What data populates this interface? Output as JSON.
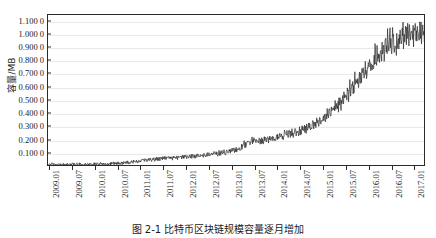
{
  "figure": {
    "caption": "图 2-1  比特币区块链规模容量逐月增加",
    "background": "#ffffff",
    "line_color": "#2b2b2b",
    "grid_color": "#e9e9e9",
    "axis_color": "#2b2b2b"
  },
  "chart_data": {
    "type": "line",
    "title": "",
    "xlabel": "",
    "ylabel": "容量/MB",
    "ylim": [
      0,
      1.15
    ],
    "ytick_labels": [
      "1.100 0",
      "1.000 0",
      "0.900 0",
      "0.800 0",
      "0.700 0",
      "0.600 0",
      "0.500 0",
      "0.400 0",
      "0.300 0",
      "0.200 0",
      "0.100 0"
    ],
    "ytick_values": [
      1.1,
      1.0,
      0.9,
      0.8,
      0.7,
      0.6,
      0.5,
      0.4,
      0.3,
      0.2,
      0.1
    ],
    "xtick_labels": [
      "2009.01",
      "2009.07",
      "2010.01",
      "2010.07",
      "2011.01",
      "2011.07",
      "2012.01",
      "2012.07",
      "2013.01",
      "2013.07",
      "2014.01",
      "2014.07",
      "2015.01",
      "2015.07",
      "2016.01",
      "2016.07",
      "2017.01"
    ],
    "grid": "horizontal",
    "legend": "none",
    "series": [
      {
        "name": "平均区块容量",
        "x_start": "2009.01",
        "x_end": "2017.04",
        "values": [
          0.002,
          0.002,
          0.002,
          0.003,
          0.002,
          0.002,
          0.003,
          0.002,
          0.002,
          0.003,
          0.002,
          0.003,
          0.002,
          0.003,
          0.003,
          0.002,
          0.003,
          0.003,
          0.002,
          0.003,
          0.003,
          0.003,
          0.004,
          0.003,
          0.003,
          0.004,
          0.003,
          0.004,
          0.004,
          0.003,
          0.004,
          0.004,
          0.005,
          0.004,
          0.005,
          0.004,
          0.005,
          0.005,
          0.006,
          0.005,
          0.006,
          0.006,
          0.007,
          0.006,
          0.007,
          0.008,
          0.007,
          0.008,
          0.009,
          0.008,
          0.01,
          0.009,
          0.011,
          0.01,
          0.012,
          0.011,
          0.013,
          0.012,
          0.014,
          0.013,
          0.016,
          0.014,
          0.018,
          0.016,
          0.02,
          0.018,
          0.022,
          0.02,
          0.025,
          0.022,
          0.028,
          0.025,
          0.03,
          0.027,
          0.033,
          0.03,
          0.036,
          0.032,
          0.038,
          0.034,
          0.04,
          0.036,
          0.042,
          0.038,
          0.044,
          0.04,
          0.046,
          0.042,
          0.048,
          0.044,
          0.05,
          0.046,
          0.052,
          0.048,
          0.054,
          0.05,
          0.056,
          0.052,
          0.055,
          0.05,
          0.055,
          0.052,
          0.058,
          0.054,
          0.06,
          0.055,
          0.062,
          0.058,
          0.06,
          0.056,
          0.062,
          0.058,
          0.064,
          0.06,
          0.066,
          0.062,
          0.068,
          0.064,
          0.07,
          0.066,
          0.072,
          0.068,
          0.075,
          0.07,
          0.078,
          0.072,
          0.08,
          0.074,
          0.082,
          0.076,
          0.085,
          0.078,
          0.088,
          0.08,
          0.09,
          0.083,
          0.092,
          0.085,
          0.095,
          0.088,
          0.098,
          0.09,
          0.1,
          0.093,
          0.105,
          0.097,
          0.11,
          0.102,
          0.115,
          0.107,
          0.12,
          0.112,
          0.13,
          0.12,
          0.145,
          0.135,
          0.16,
          0.148,
          0.175,
          0.16,
          0.185,
          0.17,
          0.195,
          0.178,
          0.205,
          0.188,
          0.2,
          0.182,
          0.195,
          0.178,
          0.19,
          0.175,
          0.195,
          0.18,
          0.2,
          0.185,
          0.205,
          0.19,
          0.21,
          0.195,
          0.215,
          0.2,
          0.22,
          0.205,
          0.225,
          0.21,
          0.23,
          0.212,
          0.235,
          0.218,
          0.24,
          0.222,
          0.245,
          0.228,
          0.25,
          0.232,
          0.255,
          0.238,
          0.26,
          0.242,
          0.268,
          0.248,
          0.275,
          0.255,
          0.285,
          0.262,
          0.295,
          0.272,
          0.305,
          0.282,
          0.315,
          0.292,
          0.325,
          0.302,
          0.34,
          0.315,
          0.355,
          0.328,
          0.37,
          0.342,
          0.385,
          0.355,
          0.4,
          0.37,
          0.42,
          0.388,
          0.44,
          0.405,
          0.46,
          0.425,
          0.48,
          0.442,
          0.5,
          0.462,
          0.52,
          0.48,
          0.545,
          0.5,
          0.57,
          0.525,
          0.595,
          0.548,
          0.62,
          0.57,
          0.645,
          0.595,
          0.67,
          0.618,
          0.695,
          0.64,
          0.72,
          0.665,
          0.745,
          0.688,
          0.77,
          0.71,
          0.795,
          0.732,
          0.82,
          0.755,
          0.845,
          0.778,
          0.865,
          0.798,
          0.885,
          0.818,
          0.905,
          0.838,
          0.925,
          0.858,
          0.945,
          0.875,
          0.96,
          0.89,
          0.975,
          0.905,
          0.985,
          0.915,
          0.995,
          0.925,
          1.005,
          0.935,
          1.015,
          0.945,
          1.02,
          0.95,
          1.025,
          0.955,
          1.03,
          0.96,
          1.035,
          0.962,
          1.038,
          0.965,
          1.04,
          0.968,
          1.042,
          0.97,
          1.045,
          0.972
        ]
      }
    ]
  }
}
